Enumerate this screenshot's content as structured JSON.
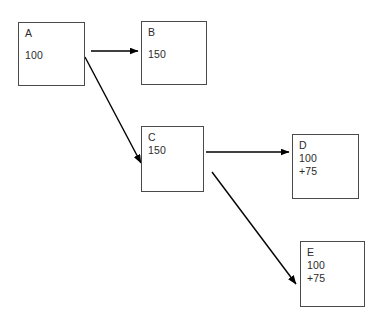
{
  "diagram": {
    "background_color": "#ffffff",
    "box_border_color": "#4a4a4a",
    "text_color": "#2b2b2b",
    "arrow_color": "#000000",
    "nodes": [
      {
        "id": "A",
        "label": "A",
        "value": "100",
        "extra": "",
        "spaced": true,
        "x": 18,
        "y": 22,
        "width": 67,
        "height": 64
      },
      {
        "id": "B",
        "label": "B",
        "value": "150",
        "extra": "",
        "spaced": true,
        "x": 141,
        "y": 21,
        "width": 66,
        "height": 64
      },
      {
        "id": "C",
        "label": "C",
        "value": "150",
        "extra": "",
        "spaced": false,
        "x": 141,
        "y": 126,
        "width": 63,
        "height": 66
      },
      {
        "id": "D",
        "label": "D",
        "value": "100",
        "extra": "+75",
        "spaced": false,
        "x": 292,
        "y": 134,
        "width": 67,
        "height": 65
      },
      {
        "id": "E",
        "label": "E",
        "value": "100",
        "extra": "+75",
        "spaced": false,
        "x": 300,
        "y": 241,
        "width": 65,
        "height": 66
      }
    ],
    "edges": [
      {
        "id": "a-to-b",
        "from": "A",
        "to": "B",
        "x1": 91,
        "y1": 51,
        "x2": 138,
        "y2": 51
      },
      {
        "id": "a-to-c",
        "from": "A",
        "to": "C",
        "x1": 85,
        "y1": 57,
        "x2": 141,
        "y2": 163
      },
      {
        "id": "c-to-d",
        "from": "C",
        "to": "D",
        "x1": 206,
        "y1": 152,
        "x2": 289,
        "y2": 152
      },
      {
        "id": "c-to-e",
        "from": "C",
        "to": "E",
        "x1": 212,
        "y1": 172,
        "x2": 296,
        "y2": 284
      }
    ]
  }
}
